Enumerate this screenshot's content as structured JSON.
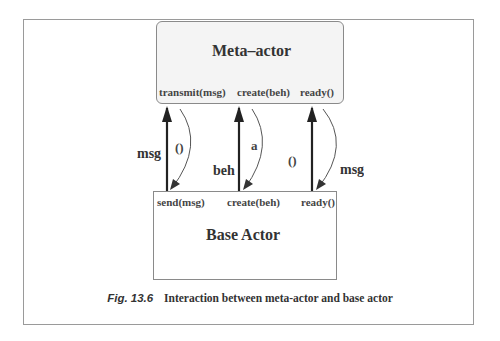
{
  "diagram": {
    "meta_actor": {
      "title": "Meta–actor",
      "methods": [
        "transmit(msg)",
        "create(beh)",
        "ready()"
      ]
    },
    "base_actor": {
      "title": "Base Actor",
      "methods": [
        "send(msg)",
        "create(beh)",
        "ready()"
      ]
    },
    "interactions": [
      {
        "up_label": "msg",
        "down_label": "()"
      },
      {
        "up_label": "beh",
        "down_label": "a"
      },
      {
        "up_label": "()",
        "down_label": "msg"
      }
    ],
    "colors": {
      "meta_fill": "#f4f4f4",
      "border": "#8a8a8a",
      "arrow": "#222222"
    }
  },
  "caption": {
    "figure_number": "Fig. 13.6",
    "text": "Interaction between meta-actor and base actor"
  }
}
